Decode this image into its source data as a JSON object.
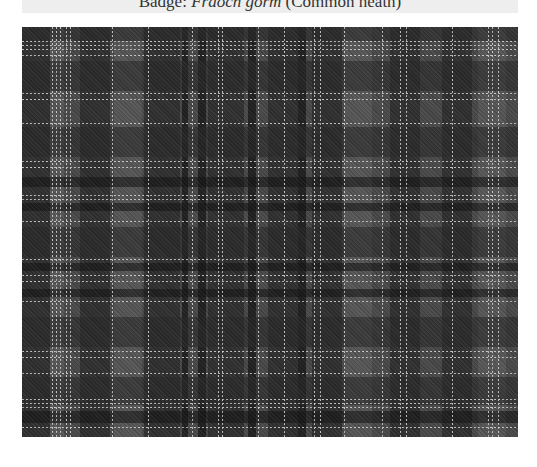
{
  "caption": {
    "prefix": "Badge: ",
    "badge_gaelic": "Fraoch gorm",
    "badge_english": " (Common heath)"
  },
  "tartan": {
    "description": "Grayscale tartan sett swatch",
    "colors": {
      "ground": "#4a4a4a",
      "dark": "#2a2a2a",
      "black": "#151515",
      "mid": "#5c5c5c",
      "light_line": "#d8d8d8"
    },
    "vertical_bands": [
      {
        "x": 0,
        "w": 28,
        "shade": "dark"
      },
      {
        "x": 28,
        "w": 14,
        "shade": "mid"
      },
      {
        "x": 58,
        "w": 30,
        "shade": "dark"
      },
      {
        "x": 92,
        "w": 28,
        "shade": "mid"
      },
      {
        "x": 122,
        "w": 36,
        "shade": "dark"
      },
      {
        "x": 160,
        "w": 6,
        "shade": "black"
      },
      {
        "x": 176,
        "w": 8,
        "shade": "black"
      },
      {
        "x": 186,
        "w": 36,
        "shade": "dark"
      },
      {
        "x": 226,
        "w": 8,
        "shade": "black"
      },
      {
        "x": 246,
        "w": 30,
        "shade": "dark"
      },
      {
        "x": 276,
        "w": 8,
        "shade": "black"
      },
      {
        "x": 290,
        "w": 30,
        "shade": "dark"
      },
      {
        "x": 322,
        "w": 28,
        "shade": "mid"
      },
      {
        "x": 368,
        "w": 30,
        "shade": "dark"
      },
      {
        "x": 420,
        "w": 30,
        "shade": "dark"
      },
      {
        "x": 456,
        "w": 28,
        "shade": "mid"
      }
    ],
    "horizontal_bands": [
      {
        "y": 0,
        "w": 14,
        "shade": "dark"
      },
      {
        "y": 34,
        "w": 30,
        "shade": "dark"
      },
      {
        "y": 100,
        "w": 30,
        "shade": "dark"
      },
      {
        "y": 150,
        "w": 10,
        "shade": "black"
      },
      {
        "y": 176,
        "w": 8,
        "shade": "black"
      },
      {
        "y": 200,
        "w": 30,
        "shade": "dark"
      },
      {
        "y": 236,
        "w": 8,
        "shade": "black"
      },
      {
        "y": 262,
        "w": 8,
        "shade": "black"
      },
      {
        "y": 290,
        "w": 30,
        "shade": "dark"
      },
      {
        "y": 350,
        "w": 28,
        "shade": "dark"
      },
      {
        "y": 384,
        "w": 12,
        "shade": "black"
      }
    ],
    "vertical_lines_x": [
      30,
      34,
      38,
      44,
      48,
      90,
      126,
      170,
      196,
      200,
      236,
      262,
      292,
      298,
      322,
      360,
      378,
      384,
      430,
      466,
      470,
      476
    ],
    "horizontal_lines_y": [
      14,
      18,
      22,
      28,
      66,
      72,
      96,
      134,
      140,
      168,
      172,
      194,
      232,
      248,
      254,
      274,
      324,
      330,
      346,
      372,
      376,
      380,
      400
    ]
  }
}
